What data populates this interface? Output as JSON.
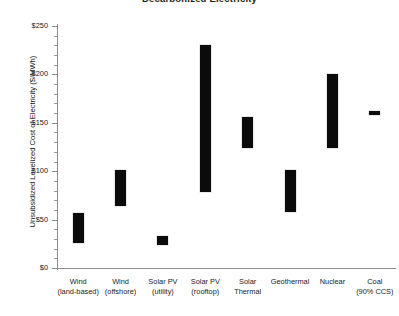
{
  "chart_data": {
    "type": "bar",
    "subtype": "floating-range-bar",
    "title": "Decarbonized Electricity",
    "xlabel": "",
    "ylabel": "Unsubsidized Levelized Cost of Electricity ($/MWh)",
    "ylim": [
      0,
      250
    ],
    "yticks": [
      0,
      50,
      100,
      150,
      200,
      250
    ],
    "ytick_labels": [
      "$0",
      "$50",
      "$100",
      "$150",
      "$200",
      "$250"
    ],
    "y_minor_tick_step": 10,
    "grid": false,
    "legend": false,
    "bar_color": "#0b0b0b",
    "categories": [
      "Wind (land-based)",
      "Wind (offshore)",
      "Solar PV (utility)",
      "Solar PV (rooftop)",
      "Solar Thermal",
      "Geothermal",
      "Nuclear",
      "Coal (90% CCS)"
    ],
    "category_lines": [
      [
        "Wind",
        "(land-based)"
      ],
      [
        "Wind",
        "(offshore)"
      ],
      [
        "Solar PV",
        "(utility)"
      ],
      [
        "Solar PV",
        "(rooftop)"
      ],
      [
        "Solar",
        "Thermal"
      ],
      [
        "Geothermal",
        ""
      ],
      [
        "Nuclear",
        ""
      ],
      [
        "Coal",
        "(90% CCS)"
      ]
    ],
    "ranges": [
      {
        "category": "Wind (land-based)",
        "low": 26,
        "high": 57
      },
      {
        "category": "Wind (offshore)",
        "low": 64,
        "high": 101
      },
      {
        "category": "Solar PV (utility)",
        "low": 24,
        "high": 33
      },
      {
        "category": "Solar PV (rooftop)",
        "low": 79,
        "high": 230
      },
      {
        "category": "Solar Thermal",
        "low": 124,
        "high": 156
      },
      {
        "category": "Geothermal",
        "low": 58,
        "high": 101
      },
      {
        "category": "Nuclear",
        "low": 124,
        "high": 200
      },
      {
        "category": "Coal (90% CCS)",
        "low": 158,
        "high": 162
      }
    ]
  }
}
